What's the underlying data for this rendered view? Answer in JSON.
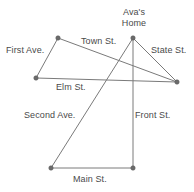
{
  "figure": {
    "type": "street-map-diagram",
    "width": 194,
    "height": 192,
    "background_color": "#ffffff",
    "line_color": "#7a7a7a",
    "node_color": "#6b6b6b",
    "text_color": "#4a4a4a"
  },
  "labels": {
    "avas_home_line1": "Ava's",
    "avas_home_line2": "Home",
    "first_ave": "First Ave.",
    "town_st": "Town St.",
    "state_st": "State St.",
    "elm_st": "Elm St.",
    "second_ave": "Second Ave.",
    "front_st": "Front St.",
    "main_st": "Main St."
  },
  "nodes": [
    {
      "id": "avas-home",
      "x": 133,
      "y": 38,
      "label": "Ava's Home"
    },
    {
      "id": "town-west",
      "x": 58,
      "y": 38,
      "label": ""
    },
    {
      "id": "elm-west",
      "x": 36,
      "y": 78,
      "label": ""
    },
    {
      "id": "east-corner",
      "x": 177,
      "y": 82,
      "label": ""
    },
    {
      "id": "main-west",
      "x": 51,
      "y": 168,
      "label": ""
    },
    {
      "id": "main-east",
      "x": 133,
      "y": 168,
      "label": ""
    }
  ],
  "streets": [
    {
      "name": "Town St.",
      "from": "town-west",
      "to": "east-corner"
    },
    {
      "name": "First Ave.",
      "from": "town-west",
      "to": "elm-west"
    },
    {
      "name": "Elm St.",
      "from": "elm-west",
      "to": "east-corner"
    },
    {
      "name": "State St.",
      "from": "avas-home",
      "to": "east-corner"
    },
    {
      "name": "Second Ave.",
      "from": "avas-home",
      "to": "main-west"
    },
    {
      "name": "Front St.",
      "from": "avas-home",
      "to": "main-east"
    },
    {
      "name": "Main St.",
      "from": "main-west",
      "to": "main-east"
    }
  ],
  "label_positions": {
    "avas_home": {
      "x": 113,
      "y": 8
    },
    "first_ave": {
      "x": 6,
      "y": 45
    },
    "town_st": {
      "x": 81,
      "y": 37
    },
    "state_st": {
      "x": 150,
      "y": 45
    },
    "elm_st": {
      "x": 55,
      "y": 82
    },
    "second_ave": {
      "x": 24,
      "y": 111
    },
    "front_st": {
      "x": 134,
      "y": 111
    },
    "main_st": {
      "x": 72,
      "y": 174
    }
  }
}
